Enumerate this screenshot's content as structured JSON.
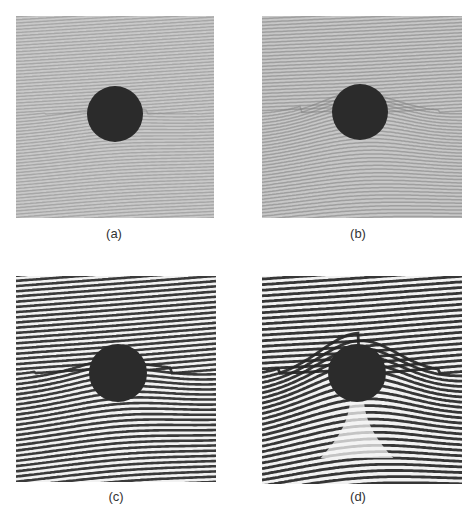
{
  "figure": {
    "panels": [
      {
        "id": "a",
        "caption": "(a)",
        "x": 16,
        "y": 16,
        "w": 198,
        "h": 202,
        "cx": 115,
        "cy": 114,
        "r": 28,
        "style": "fine",
        "bend": 0.15,
        "tilt": -0.18,
        "bg": "#c9c9c9",
        "fringe": "#8a8a8a",
        "fringe_period": 3.2,
        "stem": 0,
        "caption_x": 100,
        "caption_y": 234
      },
      {
        "id": "b",
        "caption": "(b)",
        "x": 262,
        "y": 16,
        "w": 200,
        "h": 202,
        "cx": 360,
        "cy": 112,
        "r": 28,
        "style": "fine",
        "bend": 0.55,
        "tilt": -0.14,
        "bg": "#c7c7c7",
        "fringe": "#7e7e7e",
        "fringe_period": 3.4,
        "stem": 0,
        "caption_x": 344,
        "caption_y": 234
      },
      {
        "id": "c",
        "caption": "(c)",
        "x": 16,
        "y": 276,
        "w": 200,
        "h": 206,
        "cx": 118,
        "cy": 373,
        "r": 29,
        "style": "coarse",
        "bend": 0.35,
        "tilt": -0.22,
        "bg": "#f2f2f2",
        "fringe": "#2a2a2a",
        "fringe_period": 5.2,
        "stem": 0,
        "caption_x": 102,
        "caption_y": 497
      },
      {
        "id": "d",
        "caption": "(d)",
        "x": 262,
        "y": 276,
        "w": 200,
        "h": 208,
        "cx": 357,
        "cy": 373,
        "r": 29,
        "style": "coarse",
        "bend": 1.0,
        "tilt": -0.2,
        "bg": "#f2f2f2",
        "fringe": "#262626",
        "fringe_period": 5.6,
        "stem": 14,
        "caption_x": 344,
        "caption_y": 497
      }
    ],
    "disk_color": "#2b2b2b"
  }
}
